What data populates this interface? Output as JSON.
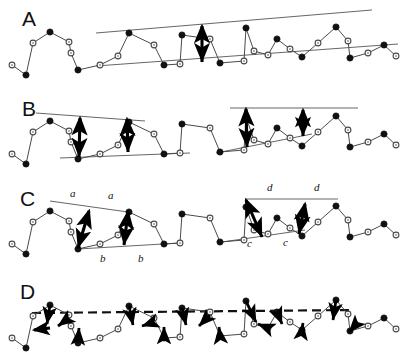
{
  "figure": {
    "width": 412,
    "height": 356,
    "background": "#ffffff",
    "ink": "#111111",
    "series_line_color": "#4a4a4a",
    "envelope_color": "#555555",
    "arrow_color": "#000000",
    "panels": [
      {
        "id": "A",
        "letter": "A",
        "letter_x": 22,
        "letter_y": 26,
        "baseline_y": 45,
        "description": "series with single upper and lower envelope lines and one vertical double arrow",
        "envelopes": [
          {
            "name": "envelope-upper",
            "x1": 96,
            "y1": 33,
            "x2": 372,
            "y2": 10,
            "style": "solid"
          },
          {
            "name": "envelope-lower",
            "x1": 96,
            "y1": 66,
            "x2": 398,
            "y2": 44,
            "style": "solid"
          }
        ],
        "arrows": [
          {
            "name": "amplitude-arrow",
            "x1": 202,
            "y1": 26,
            "x2": 202,
            "y2": 62,
            "heads": "both"
          }
        ],
        "labels": []
      },
      {
        "id": "B",
        "letter": "B",
        "letter_x": 22,
        "letter_y": 116,
        "baseline_y": 134,
        "description": "series with two local envelope pairs, each spanned by two vertical double arrows",
        "envelopes": [
          {
            "name": "envelope-upper-left",
            "x1": 36,
            "y1": 113,
            "x2": 145,
            "y2": 121,
            "style": "solid"
          },
          {
            "name": "envelope-lower-left",
            "x1": 60,
            "y1": 158,
            "x2": 190,
            "y2": 153,
            "style": "solid"
          },
          {
            "name": "envelope-upper-right",
            "x1": 230,
            "y1": 108,
            "x2": 358,
            "y2": 108,
            "style": "solid"
          },
          {
            "name": "envelope-lower-right",
            "x1": 216,
            "y1": 153,
            "x2": 312,
            "y2": 134,
            "style": "solid"
          }
        ],
        "arrows": [
          {
            "name": "amplitude-arrow-b1",
            "x1": 80,
            "y1": 118,
            "x2": 79,
            "y2": 157,
            "heads": "both"
          },
          {
            "name": "amplitude-arrow-b2",
            "x1": 127,
            "y1": 119,
            "x2": 128,
            "y2": 152,
            "heads": "both"
          },
          {
            "name": "amplitude-arrow-b3",
            "x1": 246,
            "y1": 109,
            "x2": 247,
            "y2": 147,
            "heads": "both"
          },
          {
            "name": "amplitude-arrow-b4",
            "x1": 303,
            "y1": 110,
            "x2": 303,
            "y2": 136,
            "heads": "both"
          }
        ],
        "labels": []
      },
      {
        "id": "C",
        "letter": "C",
        "letter_x": 20,
        "letter_y": 206,
        "baseline_y": 224,
        "description": "series with local envelopes and slanted double arrows labelled a, a, b, b on the left and d, d, c, c on the right",
        "envelopes": [
          {
            "name": "envelope-upper-left",
            "x1": 50,
            "y1": 201,
            "x2": 128,
            "y2": 212,
            "style": "solid"
          },
          {
            "name": "envelope-lower-left",
            "x1": 78,
            "y1": 249,
            "x2": 180,
            "y2": 243,
            "style": "solid"
          },
          {
            "name": "envelope-upper-right",
            "x1": 245,
            "y1": 199,
            "x2": 338,
            "y2": 199,
            "style": "solid"
          },
          {
            "name": "envelope-lower-right",
            "x1": 222,
            "y1": 242,
            "x2": 305,
            "y2": 230,
            "style": "solid"
          }
        ],
        "arrows": [
          {
            "name": "amplitude-arrow-a1",
            "x1": 89,
            "y1": 211,
            "x2": 78,
            "y2": 248,
            "heads": "both"
          },
          {
            "name": "amplitude-arrow-a2",
            "x1": 128,
            "y1": 212,
            "x2": 124,
            "y2": 245,
            "heads": "both"
          },
          {
            "name": "amplitude-arrow-c1",
            "x1": 246,
            "y1": 200,
            "x2": 262,
            "y2": 237,
            "heads": "both"
          },
          {
            "name": "amplitude-arrow-c2",
            "x1": 305,
            "y1": 204,
            "x2": 299,
            "y2": 234,
            "heads": "both"
          }
        ],
        "labels": [
          {
            "name": "label-a-left",
            "text": "a",
            "x": 70,
            "y": 197
          },
          {
            "name": "label-a-right",
            "text": "a",
            "x": 108,
            "y": 199
          },
          {
            "name": "label-b-left",
            "text": "b",
            "x": 100,
            "y": 262
          },
          {
            "name": "label-b-right",
            "text": "b",
            "x": 138,
            "y": 262
          },
          {
            "name": "label-d-left",
            "text": "d",
            "x": 267,
            "y": 191
          },
          {
            "name": "label-d-right",
            "text": "d",
            "x": 314,
            "y": 191
          },
          {
            "name": "label-c-left",
            "text": "c",
            "x": 247,
            "y": 247
          },
          {
            "name": "label-c-right",
            "text": "c",
            "x": 283,
            "y": 246
          }
        ]
      },
      {
        "id": "D",
        "letter": "D",
        "letter_x": 20,
        "letter_y": 299,
        "baseline_y": 318,
        "description": "series with a horizontal dashed trend line and many short bold arrows from peaks and troughs toward the trend line",
        "envelopes": [
          {
            "name": "trend-line-dashed",
            "x1": 32,
            "y1": 313,
            "x2": 352,
            "y2": 310,
            "style": "dashed"
          }
        ],
        "arrows": [],
        "labels": []
      }
    ],
    "series": {
      "note": "one common zigzag series, repeated in every panel; y values are panel-relative offsets from the panel baseline",
      "marker_filled": "filled-circle",
      "marker_open": "open-circle",
      "points": [
        {
          "x": 12,
          "dy": 20,
          "marker": "open"
        },
        {
          "x": 26,
          "dy": 30,
          "marker": "filled"
        },
        {
          "x": 33,
          "dy": -2,
          "marker": "open"
        },
        {
          "x": 50,
          "dy": -13,
          "marker": "filled"
        },
        {
          "x": 69,
          "dy": -3,
          "marker": "open"
        },
        {
          "x": 71,
          "dy": 8,
          "marker": "open"
        },
        {
          "x": 78,
          "dy": 25,
          "marker": "filled"
        },
        {
          "x": 100,
          "dy": 20,
          "marker": "open"
        },
        {
          "x": 118,
          "dy": 11,
          "marker": "open"
        },
        {
          "x": 129,
          "dy": -12,
          "marker": "filled"
        },
        {
          "x": 154,
          "dy": 0,
          "marker": "open"
        },
        {
          "x": 164,
          "dy": 20,
          "marker": "filled"
        },
        {
          "x": 180,
          "dy": 19,
          "marker": "open"
        },
        {
          "x": 182,
          "dy": -10,
          "marker": "filled"
        },
        {
          "x": 210,
          "dy": -6,
          "marker": "open"
        },
        {
          "x": 220,
          "dy": 18,
          "marker": "filled"
        },
        {
          "x": 244,
          "dy": 16,
          "marker": "open"
        },
        {
          "x": 246,
          "dy": -17,
          "marker": "filled"
        },
        {
          "x": 254,
          "dy": 6,
          "marker": "open"
        },
        {
          "x": 268,
          "dy": 10,
          "marker": "open"
        },
        {
          "x": 277,
          "dy": -6,
          "marker": "filled"
        },
        {
          "x": 290,
          "dy": 4,
          "marker": "open"
        },
        {
          "x": 302,
          "dy": 12,
          "marker": "filled"
        },
        {
          "x": 318,
          "dy": -2,
          "marker": "open"
        },
        {
          "x": 336,
          "dy": -18,
          "marker": "filled"
        },
        {
          "x": 348,
          "dy": -4,
          "marker": "open"
        },
        {
          "x": 350,
          "dy": 13,
          "marker": "filled"
        },
        {
          "x": 368,
          "dy": 8,
          "marker": "open"
        },
        {
          "x": 384,
          "dy": 0,
          "marker": "filled"
        },
        {
          "x": 396,
          "dy": 11,
          "marker": "open"
        }
      ]
    },
    "panel_d_arrows": [
      {
        "name": "d-arrow-1",
        "x1": 34,
        "dy1": 12,
        "x2": 50,
        "dy2": 10,
        "heads": "start"
      },
      {
        "name": "d-arrow-2",
        "x1": 50,
        "dy1": -13,
        "x2": 47,
        "dy2": 6,
        "heads": "end"
      },
      {
        "name": "d-arrow-3",
        "x1": 69,
        "dy1": 0,
        "x2": 58,
        "dy2": 8,
        "heads": "end"
      },
      {
        "name": "d-arrow-4",
        "x1": 78,
        "dy1": 25,
        "x2": 79,
        "dy2": 10,
        "heads": "end"
      },
      {
        "name": "d-arrow-5",
        "x1": 129,
        "dy1": -12,
        "x2": 133,
        "dy2": 7,
        "heads": "end"
      },
      {
        "name": "d-arrow-6",
        "x1": 154,
        "dy1": 4,
        "x2": 142,
        "dy2": 8,
        "heads": "end"
      },
      {
        "name": "d-arrow-7",
        "x1": 164,
        "dy1": 20,
        "x2": 164,
        "dy2": 9,
        "heads": "end"
      },
      {
        "name": "d-arrow-8",
        "x1": 182,
        "dy1": -10,
        "x2": 186,
        "dy2": 7,
        "heads": "end"
      },
      {
        "name": "d-arrow-9",
        "x1": 210,
        "dy1": -3,
        "x2": 199,
        "dy2": 8,
        "heads": "end"
      },
      {
        "name": "d-arrow-10",
        "x1": 220,
        "dy1": 18,
        "x2": 219,
        "dy2": 9,
        "heads": "end"
      },
      {
        "name": "d-arrow-11",
        "x1": 246,
        "dy1": -17,
        "x2": 256,
        "dy2": 4,
        "heads": "end"
      },
      {
        "name": "d-arrow-12",
        "x1": 268,
        "dy1": 10,
        "x2": 258,
        "dy2": 6,
        "heads": "end"
      },
      {
        "name": "d-arrow-13",
        "x1": 277,
        "dy1": -6,
        "x2": 282,
        "dy2": 6,
        "heads": "end"
      },
      {
        "name": "d-arrow-14",
        "x1": 302,
        "dy1": 12,
        "x2": 303,
        "dy2": 5,
        "heads": "end"
      },
      {
        "name": "d-arrow-15",
        "x1": 336,
        "dy1": -18,
        "x2": 333,
        "dy2": 2,
        "heads": "end"
      },
      {
        "name": "d-arrow-16",
        "x1": 350,
        "dy1": 13,
        "x2": 358,
        "dy2": 4,
        "heads": "start"
      }
    ]
  }
}
